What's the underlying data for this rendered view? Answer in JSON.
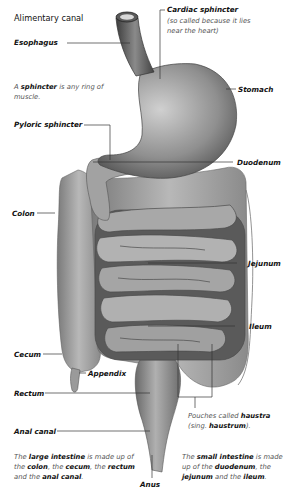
{
  "title": "Alimentary canal",
  "labels": {
    "esophagus": "Esophagus",
    "cardiac_sphincter": "Cardiac sphincter",
    "cardiac_note": "(so called because it lies near the heart)",
    "stomach": "Stomach",
    "pyloric_sphincter": "Pyloric sphincter",
    "duodenum": "Duodenum",
    "colon": "Colon",
    "jejunum": "Jejunum",
    "ileum": "Ileum",
    "cecum": "Cecum",
    "appendix": "Appendix",
    "rectum": "Rectum",
    "anal_canal": "Anal canal",
    "anus": "Anus"
  },
  "notes": {
    "sphincter": {
      "pre": "A ",
      "bold": "sphincter",
      "post": " is any ring of muscle."
    },
    "haustra": {
      "pre": "Pouches called ",
      "bold1": "haustra",
      "mid": " (sing. ",
      "bold2": "haustrum",
      "post": ")."
    },
    "large_intestine": {
      "pre": "The ",
      "b1": "large intestine",
      "t1": " is made up of the ",
      "b2": "colon",
      "t2": ", the ",
      "b3": "cecum",
      "t3": ", the ",
      "b4": "rectum",
      "t4": " and the ",
      "b5": "anal canal",
      "t5": "."
    },
    "small_intestine": {
      "pre": "The ",
      "b1": "small intestine",
      "t1": " is made up of the ",
      "b2": "duodenum",
      "t2": ", the ",
      "b3": "jejunum",
      "t3": " and the ",
      "b4": "ileum",
      "t4": "."
    }
  },
  "colors": {
    "organ_dark": "#4a4a4a",
    "organ_mid": "#8a8a8a",
    "organ_light": "#bdbdbd",
    "leader": "#333333"
  }
}
